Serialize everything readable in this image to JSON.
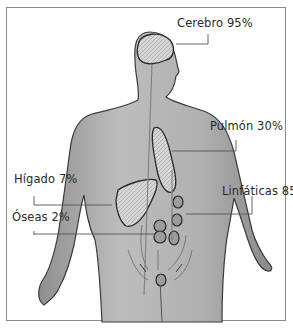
{
  "diagram": {
    "labels": [
      {
        "id": "cerebro",
        "text": "Cerebro 95%"
      },
      {
        "id": "pulmon",
        "text": "Pulmón 30%"
      },
      {
        "id": "higado",
        "text": "Hígado 7%"
      },
      {
        "id": "linfaticas",
        "text": "Linfáticas 85%"
      },
      {
        "id": "oseas",
        "text": "Óseas 2%"
      }
    ],
    "colors": {
      "body_fill": "#b8b8b8",
      "body_shade": "#8e8e8e",
      "organ_fill": "#d4d4d4",
      "outline": "#333333",
      "leader_line": "#555555",
      "frame": "#8a8a8a"
    }
  }
}
